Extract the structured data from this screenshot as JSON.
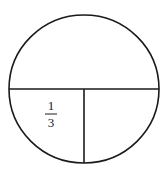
{
  "diagram": {
    "type": "circle-fraction",
    "label": {
      "numerator": "1",
      "denominator": "3"
    },
    "colors": {
      "stroke": "#1a1a1a",
      "background": "#ffffff"
    }
  }
}
